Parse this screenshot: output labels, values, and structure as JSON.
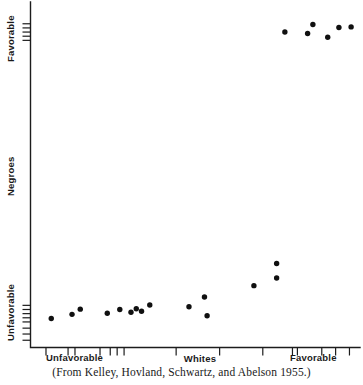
{
  "figure": {
    "caption": "(From Kelley, Hovland, Schwartz, and Abelson 1955.)"
  },
  "chart_data": {
    "type": "scatter",
    "title": "",
    "xlabel": "Whites",
    "ylabel": "Negroes",
    "x_axis_low_label": "Unfavorable",
    "x_axis_high_label": "Favorable",
    "y_axis_low_label": "Unfavorable",
    "y_axis_high_label": "Favorable",
    "xlim": [
      0,
      100
    ],
    "ylim": [
      0,
      100
    ],
    "grid": false,
    "legend": "none",
    "x_ticks": [
      4.7,
      11.4,
      13.5,
      21.1,
      24.2,
      26.3,
      28.4,
      44.2,
      57.4,
      70.5,
      79.5,
      81.0,
      88.4,
      92.6,
      96.8
    ],
    "y_ticks": [
      2.1,
      3.9,
      5.6,
      7.4,
      8.6,
      9.8,
      11.0,
      12.2,
      88.9,
      90.1,
      91.3,
      92.5,
      93.7
    ],
    "points": [
      {
        "x": 6.3,
        "y": 8.4
      },
      {
        "x": 12.6,
        "y": 9.6
      },
      {
        "x": 15.1,
        "y": 11.1
      },
      {
        "x": 23.3,
        "y": 9.9
      },
      {
        "x": 27.1,
        "y": 11.0
      },
      {
        "x": 30.5,
        "y": 10.2
      },
      {
        "x": 32.1,
        "y": 11.2
      },
      {
        "x": 33.7,
        "y": 10.5
      },
      {
        "x": 36.2,
        "y": 12.3
      },
      {
        "x": 48.1,
        "y": 11.8
      },
      {
        "x": 52.8,
        "y": 14.6
      },
      {
        "x": 53.6,
        "y": 9.2
      },
      {
        "x": 67.8,
        "y": 17.9
      },
      {
        "x": 74.7,
        "y": 24.3
      },
      {
        "x": 74.7,
        "y": 20.1
      },
      {
        "x": 77.2,
        "y": 91.3
      },
      {
        "x": 84.1,
        "y": 90.9
      },
      {
        "x": 85.7,
        "y": 93.5
      },
      {
        "x": 90.2,
        "y": 89.8
      },
      {
        "x": 93.6,
        "y": 92.6
      },
      {
        "x": 97.3,
        "y": 92.8
      }
    ]
  }
}
